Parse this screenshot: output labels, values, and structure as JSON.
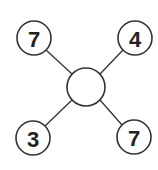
{
  "diagram": {
    "type": "hub-and-spoke",
    "center": {
      "label": "",
      "cx": 86,
      "cy": 87,
      "r": 19
    },
    "nodes": [
      {
        "id": "top-left",
        "label": "7",
        "cx": 34,
        "cy": 38,
        "r": 17
      },
      {
        "id": "top-right",
        "label": "4",
        "cx": 135,
        "cy": 38,
        "r": 17
      },
      {
        "id": "bottom-left",
        "label": "3",
        "cx": 33,
        "cy": 138,
        "r": 17
      },
      {
        "id": "bottom-right",
        "label": "7",
        "cx": 134,
        "cy": 137,
        "r": 17
      }
    ],
    "colors": {
      "stroke": "#333333",
      "fill": "#ffffff",
      "text": "#222222"
    }
  }
}
